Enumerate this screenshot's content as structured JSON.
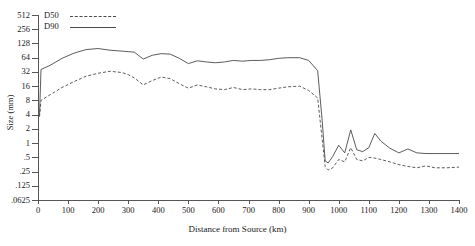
{
  "chart_data": {
    "type": "line",
    "title": "",
    "xlabel": "Distance from Source (km)",
    "ylabel": "Size (mm)",
    "xlim": [
      0,
      1400
    ],
    "ylim": [
      0.0625,
      512
    ],
    "yscale": "log2",
    "grid": false,
    "legend_position": "top-left",
    "xticks": [
      0,
      100,
      200,
      300,
      400,
      500,
      600,
      700,
      800,
      900,
      1000,
      1100,
      1200,
      1300,
      1400
    ],
    "xtick_labels": [
      "0",
      "100",
      "200",
      "300",
      "400",
      "500",
      "600",
      "700",
      "800",
      "900",
      "1000",
      "1100",
      "1200",
      "1300",
      "1400"
    ],
    "yticks": [
      512,
      256,
      128,
      64,
      32,
      16,
      8,
      4,
      2,
      1,
      0.5,
      0.25,
      0.125,
      0.0625
    ],
    "ytick_labels": [
      "512",
      "256",
      "128",
      "64",
      "32",
      "16",
      "8",
      "4",
      "2",
      "1",
      ".5",
      ".25",
      ".125",
      ".0625"
    ],
    "series": [
      {
        "name": "D50",
        "style": "dashed",
        "color": "#4a4a4a",
        "x": [
          5,
          10,
          40,
          80,
          120,
          160,
          200,
          240,
          280,
          300,
          320,
          350,
          380,
          410,
          440,
          470,
          500,
          530,
          560,
          590,
          620,
          650,
          680,
          710,
          740,
          770,
          800,
          830,
          870,
          900,
          930,
          945,
          955,
          965,
          980,
          1000,
          1020,
          1040,
          1060,
          1080,
          1100,
          1120,
          1140,
          1170,
          1200,
          1230,
          1260,
          1290,
          1320,
          1360,
          1400
        ],
        "y": [
          3.6,
          8.0,
          10.5,
          15.0,
          20.0,
          26.0,
          30.0,
          33.0,
          31.0,
          28.0,
          24.0,
          17.0,
          21.0,
          25.0,
          23.0,
          18.0,
          14.5,
          17.0,
          15.5,
          14.0,
          13.5,
          15.0,
          13.5,
          14.0,
          13.5,
          13.5,
          14.5,
          15.5,
          16.0,
          13.0,
          9.0,
          1.2,
          0.32,
          0.27,
          0.3,
          0.45,
          0.4,
          0.8,
          0.45,
          0.42,
          0.5,
          0.48,
          0.45,
          0.4,
          0.35,
          0.32,
          0.3,
          0.33,
          0.3,
          0.3,
          0.31
        ]
      },
      {
        "name": "D90",
        "style": "solid",
        "color": "#4a4a4a",
        "x": [
          5,
          10,
          40,
          80,
          120,
          160,
          200,
          240,
          280,
          300,
          320,
          350,
          380,
          410,
          440,
          470,
          500,
          530,
          560,
          590,
          620,
          650,
          680,
          710,
          740,
          770,
          800,
          830,
          870,
          900,
          930,
          945,
          955,
          965,
          980,
          1000,
          1020,
          1040,
          1060,
          1080,
          1100,
          1120,
          1140,
          1170,
          1200,
          1230,
          1260,
          1290,
          1320,
          1360,
          1400
        ],
        "y": [
          3.8,
          36.0,
          44.0,
          62.0,
          80.0,
          95.0,
          100.0,
          92.0,
          88.0,
          86.0,
          84.0,
          60.0,
          72.0,
          78.0,
          76.0,
          62.0,
          48.0,
          55.0,
          52.0,
          50.0,
          52.0,
          56.0,
          54.0,
          56.0,
          56.0,
          58.0,
          62.0,
          64.0,
          64.0,
          56.0,
          34.0,
          3.0,
          0.42,
          0.38,
          0.52,
          0.9,
          0.62,
          1.9,
          0.72,
          0.66,
          0.8,
          1.6,
          1.1,
          0.78,
          0.62,
          0.75,
          0.62,
          0.6,
          0.6,
          0.6,
          0.6
        ]
      }
    ]
  },
  "legend": {
    "items": [
      {
        "label": "D50",
        "style": "dashed"
      },
      {
        "label": "D90",
        "style": "solid"
      }
    ]
  }
}
